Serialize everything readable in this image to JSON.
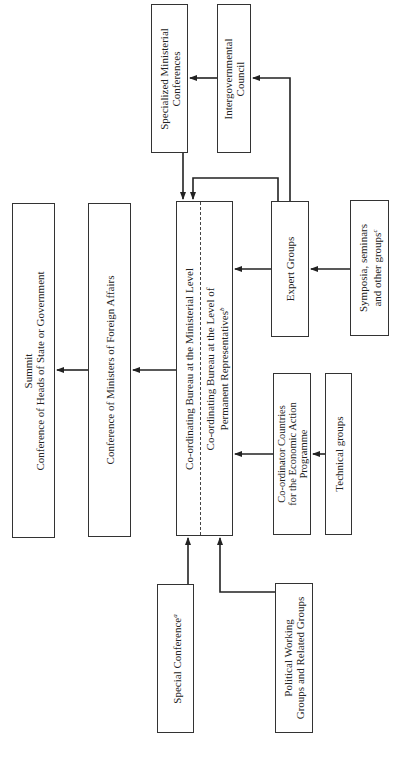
{
  "diagram": {
    "title_caption": "Structure of the Non-Aligned Movement",
    "nodes": {
      "summit": {
        "line1": "Summit",
        "line2": "Conference of Heads of State or Government"
      },
      "foreign_affairs": {
        "line1": "Conference of Ministers of Foreign Affairs"
      },
      "bureau_ministerial": {
        "line1": "Co-ordinating Bureau at the Ministerial Level"
      },
      "bureau_permanent": {
        "line1": "Co-ordinating Bureau at the Level of",
        "line2": "Permanent Representatives",
        "note": "b"
      },
      "expert_groups": {
        "line1": "Expert Groups"
      },
      "symposia": {
        "line1": "Symposia, seminars",
        "line2": "and other groups",
        "note": "c"
      },
      "coordinator_countries": {
        "line1": "Co-ordinator Countries",
        "line2": "for the Economic Action",
        "line3": "Programme"
      },
      "technical_groups": {
        "line1": "Technical groups"
      },
      "specialized_ministerial": {
        "line1": "Specialized Ministerial",
        "line2": "Conferences"
      },
      "intergovernmental": {
        "line1": "Intergovernmental",
        "line2": "Council"
      },
      "special_conference": {
        "line1": "Special Conference",
        "note": "a"
      },
      "political_working": {
        "line1": "Political Working",
        "line2": "Groups and Related Groups"
      }
    },
    "edges": [
      {
        "from": "foreign_affairs",
        "to": "summit"
      },
      {
        "from": "bureau",
        "to": "foreign_affairs"
      },
      {
        "from": "expert_groups",
        "to": "bureau"
      },
      {
        "from": "symposia",
        "to": "expert_groups"
      },
      {
        "from": "coordinator_countries",
        "to": "bureau"
      },
      {
        "from": "technical_groups",
        "to": "coordinator_countries"
      },
      {
        "from": "specialized_ministerial",
        "to": "bureau"
      },
      {
        "from": "expert_groups",
        "to": "bureau"
      },
      {
        "from": "expert_groups",
        "to": "intergovernmental"
      },
      {
        "from": "intergovernmental",
        "to": "specialized_ministerial"
      },
      {
        "from": "special_conference",
        "to": "bureau"
      },
      {
        "from": "political_working",
        "to": "bureau"
      }
    ]
  }
}
